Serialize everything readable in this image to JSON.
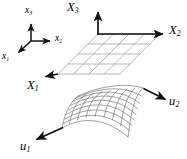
{
  "figure": {
    "kind": "math-diagram",
    "width": 187,
    "height": 159,
    "background_color": "#ffffff",
    "line_color": "#8c8c8c",
    "mesh_color": "#6e6e6e",
    "arrow_color": "#111111",
    "text_color": "#000000"
  },
  "triad": {
    "name": "local-reference-triad",
    "origin": [
      31,
      41
    ],
    "axes": [
      {
        "id": "x3",
        "symbol": "x",
        "subscript": "3",
        "label": "x₃",
        "direction": "up",
        "tip": [
          31,
          22
        ],
        "label_pos": [
          26,
          8
        ]
      },
      {
        "id": "x2",
        "symbol": "x",
        "subscript": "2",
        "label": "x₂",
        "direction": "right",
        "tip": [
          53,
          41
        ],
        "label_pos": [
          56,
          36
        ]
      },
      {
        "id": "x1",
        "symbol": "x",
        "subscript": "1",
        "label": "x₁",
        "direction": "down-left",
        "tip": [
          16,
          54
        ],
        "label_pos": [
          3,
          54
        ]
      }
    ]
  },
  "global_axes": {
    "name": "global-coordinate-axes",
    "origin": [
      98,
      34
    ],
    "axes": [
      {
        "id": "X3",
        "symbol": "X",
        "subscript": "3",
        "label": "X₃",
        "direction": "up",
        "tip": [
          98,
          10
        ],
        "label_pos": [
          68,
          2
        ]
      },
      {
        "id": "X2",
        "symbol": "X",
        "subscript": "2",
        "label": "X₂",
        "direction": "right",
        "tip": [
          166,
          34
        ],
        "label_pos": [
          169,
          25
        ]
      },
      {
        "id": "X1",
        "symbol": "X",
        "subscript": "1",
        "label": "X₁",
        "direction": "down-left",
        "tip": [
          43,
          78
        ],
        "label_pos": [
          28,
          80
        ]
      }
    ]
  },
  "reference_plane": {
    "name": "flat-parametric-grid",
    "description": "planar quadrilateral mesh in the X1-X2 plane",
    "divisions_u": 4,
    "divisions_v": 4,
    "corners": {
      "top_left": [
        98,
        34
      ],
      "top_right": [
        160,
        34
      ],
      "bottom_right": [
        120,
        74
      ],
      "bottom_left": [
        58,
        74
      ]
    }
  },
  "deformed_surface": {
    "name": "curved-deformed-mesh",
    "description": "doubly curved quadrilateral mesh surface",
    "divisions_u": 8,
    "divisions_v": 8,
    "corners": {
      "near_left": [
        62,
        128
      ],
      "top_left": [
        78,
        96
      ],
      "top_right": [
        143,
        88
      ],
      "bottom_right": [
        128,
        137
      ]
    },
    "parameter_axes": [
      {
        "id": "u1",
        "symbol": "u",
        "subscript": "1",
        "label": "u₁",
        "from": [
          62,
          128
        ],
        "tip": [
          34,
          141
        ],
        "label_pos": [
          21,
          142
        ]
      },
      {
        "id": "u2",
        "symbol": "u",
        "subscript": "2",
        "label": "u₂",
        "from": [
          144,
          88
        ],
        "tip": [
          168,
          101
        ],
        "label_pos": [
          170,
          96
        ]
      }
    ]
  },
  "labels": {
    "x1": {
      "symbol": "x",
      "sub": "1"
    },
    "x2": {
      "symbol": "x",
      "sub": "2"
    },
    "x3": {
      "symbol": "x",
      "sub": "3"
    },
    "X1": {
      "symbol": "X",
      "sub": "1"
    },
    "X2": {
      "symbol": "X",
      "sub": "2"
    },
    "X3": {
      "symbol": "X",
      "sub": "3"
    },
    "u1": {
      "symbol": "u",
      "sub": "1"
    },
    "u2": {
      "symbol": "u",
      "sub": "2"
    }
  }
}
